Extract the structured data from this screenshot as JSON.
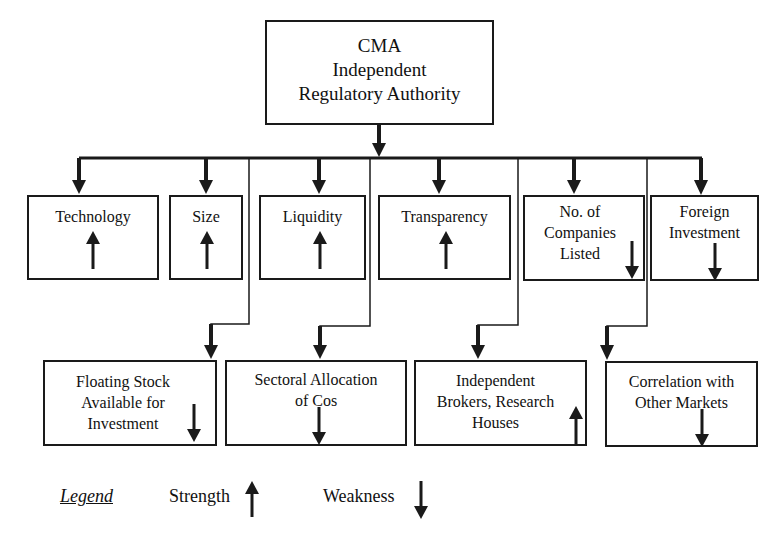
{
  "top": {
    "lines": [
      "CMA",
      "Independent",
      "Regulatory Authority"
    ]
  },
  "row1": [
    {
      "label_lines": [
        "Technology"
      ],
      "indicator": "strength"
    },
    {
      "label_lines": [
        "Size"
      ],
      "indicator": "strength"
    },
    {
      "label_lines": [
        "Liquidity"
      ],
      "indicator": "strength"
    },
    {
      "label_lines": [
        "Transparency"
      ],
      "indicator": "strength"
    },
    {
      "label_lines": [
        "No. of",
        "Companies",
        "Listed"
      ],
      "indicator": "weakness"
    },
    {
      "label_lines": [
        "Foreign",
        "Investment"
      ],
      "indicator": "weakness"
    }
  ],
  "row2": [
    {
      "label_lines": [
        "Floating Stock",
        "Available for",
        "Investment"
      ],
      "indicator": "weakness"
    },
    {
      "label_lines": [
        "Sectoral Allocation",
        "of Cos"
      ],
      "indicator": "weakness"
    },
    {
      "label_lines": [
        "Independent",
        "Brokers, Research",
        "Houses"
      ],
      "indicator": "strength"
    },
    {
      "label_lines": [
        "Correlation with",
        "Other Markets"
      ],
      "indicator": "weakness"
    }
  ],
  "legend": {
    "title": "Legend",
    "strength_label": "Strength",
    "weakness_label": "Weakness",
    "strength_icon": "arrow-up-icon",
    "weakness_icon": "arrow-down-icon"
  },
  "colors": {
    "line": "#1a1a1a",
    "background": "#ffffff"
  }
}
